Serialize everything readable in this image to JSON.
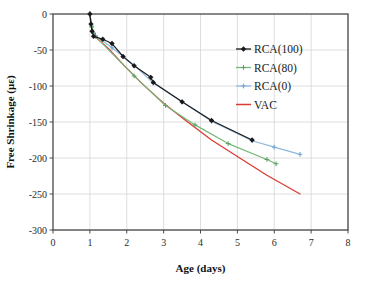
{
  "chart_data": {
    "type": "line",
    "title": "",
    "xlabel": "Age (days)",
    "ylabel": "Free Shrinkage (με)",
    "xlim": [
      0,
      8
    ],
    "ylim": [
      -300,
      0
    ],
    "xticks": [
      "0",
      "1",
      "2",
      "3",
      "4",
      "5",
      "6",
      "7",
      "8"
    ],
    "yticks": [
      "0",
      "-50",
      "-100",
      "-150",
      "-200",
      "-250",
      "-300"
    ],
    "xtick_values": [
      0,
      1,
      2,
      3,
      4,
      5,
      6,
      7,
      8
    ],
    "ytick_values": [
      0,
      -50,
      -100,
      -150,
      -200,
      -250,
      -300
    ],
    "grid": true,
    "legend_position": "upper right",
    "series": [
      {
        "name": "RCA(100)",
        "color": "#1a1a1a",
        "marker": "diamond",
        "marker_color": "#1a1a1a",
        "x": [
          1.0,
          1.03,
          1.06,
          1.1,
          1.35,
          1.6,
          1.9,
          2.2,
          2.65,
          2.72,
          3.5,
          4.3,
          5.4
        ],
        "y": [
          0,
          -14,
          -24,
          -31,
          -35,
          -41,
          -59,
          -72,
          -88,
          -95,
          -122,
          -148,
          -175
        ]
      },
      {
        "name": "RCA(80)",
        "color": "#76b87a",
        "marker": "cross",
        "marker_color": "#5aa05f",
        "x": [
          1.0,
          1.05,
          1.1,
          1.15,
          2.2,
          3.05,
          3.85,
          4.75,
          5.8,
          6.05
        ],
        "y": [
          0,
          -18,
          -27,
          -31,
          -86,
          -127,
          -154,
          -180,
          -202,
          -208
        ]
      },
      {
        "name": "RCA(0)",
        "color": "#8fb8dd",
        "marker": "bar",
        "marker_color": "#7aa8d4",
        "x": [
          1.0,
          1.05,
          1.1,
          1.15,
          1.6,
          2.2,
          2.72,
          3.5,
          4.3,
          5.4,
          6.0,
          6.7
        ],
        "y": [
          0,
          -17,
          -26,
          -30,
          -47,
          -71,
          -96,
          -122,
          -149,
          -176,
          -185,
          -195
        ]
      },
      {
        "name": "VAC",
        "color": "#d93b33",
        "marker": "none",
        "marker_color": "#d93b33",
        "x": [
          1.0,
          1.05,
          1.1,
          1.2,
          1.5,
          1.9,
          2.4,
          3.0,
          3.6,
          4.3,
          5.0,
          5.8,
          6.7
        ],
        "y": [
          0,
          -20,
          -30,
          -34,
          -48,
          -70,
          -96,
          -124,
          -148,
          -175,
          -198,
          -224,
          -250
        ]
      }
    ]
  },
  "legend": {
    "entries": [
      {
        "label": "RCA(100)"
      },
      {
        "label": "RCA(80)"
      },
      {
        "label": "RCA(0)"
      },
      {
        "label": "VAC"
      }
    ]
  },
  "colors": {
    "rca100": "#1a1a1a",
    "rca80": "#76b87a",
    "rca0": "#8fb8dd",
    "vac": "#d93b33",
    "grid": "#d5d5d5",
    "axis": "#4a4a4a",
    "text": "#1a1a1a"
  }
}
